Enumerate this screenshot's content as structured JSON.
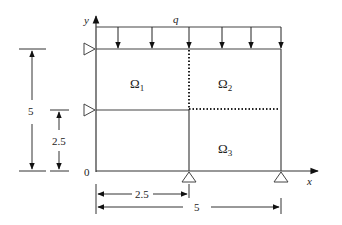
{
  "diagram": {
    "axes": {
      "x_label": "x",
      "y_label": "y",
      "origin_label": "0"
    },
    "load": {
      "label": "q"
    },
    "regions": [
      {
        "id": "omega1",
        "label": "Ω",
        "sub": "1"
      },
      {
        "id": "omega2",
        "label": "Ω",
        "sub": "2"
      },
      {
        "id": "omega3",
        "label": "Ω",
        "sub": "3"
      }
    ],
    "dimensions": {
      "height_total": "5",
      "height_half": "2.5",
      "width_half": "2.5",
      "width_total": "5"
    },
    "colors": {
      "line": "#333333",
      "background": "#ffffff"
    }
  }
}
